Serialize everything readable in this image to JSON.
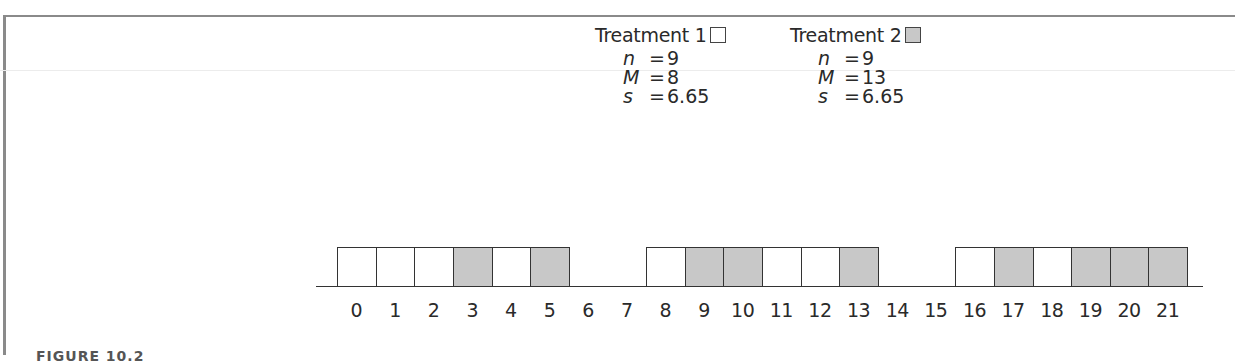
{
  "legend": {
    "treatment1": {
      "label": "Treatment 1",
      "swatch_color": "#ffffff"
    },
    "treatment2": {
      "label": "Treatment 2",
      "swatch_color": "#c8c8c8"
    }
  },
  "stats": {
    "treatment1": [
      {
        "sym": "n",
        "eq": "=",
        "val": "9"
      },
      {
        "sym": "M",
        "eq": "=",
        "val": "8"
      },
      {
        "sym": "s",
        "eq": "=",
        "val": "6.65"
      }
    ],
    "treatment2": [
      {
        "sym": "n",
        "eq": "=",
        "val": "9"
      },
      {
        "sym": "M",
        "eq": "=",
        "val": "13"
      },
      {
        "sym": "s",
        "eq": "=",
        "val": "6.65"
      }
    ]
  },
  "axis": {
    "ticks": [
      "0",
      "1",
      "2",
      "3",
      "4",
      "5",
      "6",
      "7",
      "8",
      "9",
      "10",
      "11",
      "12",
      "13",
      "14",
      "15",
      "16",
      "17",
      "18",
      "19",
      "20",
      "21"
    ]
  },
  "caption": "FIGURE 10.2",
  "chart_data": {
    "type": "dot-frequency",
    "title": "",
    "xlabel": "",
    "ylabel": "",
    "x_range": [
      0,
      21
    ],
    "series": [
      {
        "name": "Treatment 1",
        "fill": "#ffffff",
        "values": [
          0,
          1,
          2,
          4,
          8,
          11,
          12,
          16,
          18
        ],
        "n": 9,
        "M": 8,
        "s": 6.65
      },
      {
        "name": "Treatment 2",
        "fill": "#c8c8c8",
        "values": [
          3,
          5,
          9,
          10,
          13,
          17,
          19,
          20,
          21
        ],
        "n": 9,
        "M": 13,
        "s": 6.65
      }
    ]
  }
}
